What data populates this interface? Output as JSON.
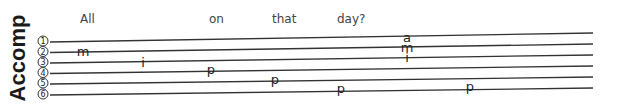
{
  "label": "Accomp",
  "lyrics": [
    {
      "text": "All",
      "x": 80
    },
    {
      "text": "on",
      "x": 209
    },
    {
      "text": "that",
      "x": 272
    },
    {
      "text": "day?",
      "x": 337
    }
  ],
  "strings": [
    "1",
    "2",
    "3",
    "4",
    "5",
    "6"
  ],
  "fingerings": [
    {
      "text": "m",
      "string": 2,
      "x": 83
    },
    {
      "text": "i",
      "string": 3,
      "x": 143
    },
    {
      "text": "p",
      "string": 4,
      "x": 211
    },
    {
      "text": "p",
      "string": 5,
      "x": 275
    },
    {
      "text": "p",
      "string": 6,
      "x": 341
    },
    {
      "text": "a",
      "string": 1,
      "x": 407
    },
    {
      "text": "m",
      "string": 2,
      "x": 407
    },
    {
      "text": "i",
      "string": 3,
      "x": 407
    },
    {
      "text": "p",
      "string": 6,
      "x": 470
    }
  ]
}
